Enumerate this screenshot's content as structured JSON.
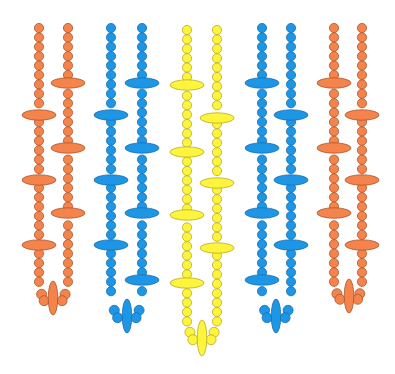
{
  "image": {
    "description": "Beaded fringe pattern illustration: five pairs of vertical bead strands (orange, blue, yellow, blue, orange), each pair joined at the bottom in a U-loop with an elongated vertical pendant bead; strands carry horizontal oval disc beads at intervals.",
    "background": "#ffffff"
  },
  "palette": {
    "orange": {
      "fill": "#f5844c",
      "stroke": "#a8552b"
    },
    "blue": {
      "fill": "#1e96e6",
      "stroke": "#1a6fae"
    },
    "yellow": {
      "fill": "#fdf43c",
      "stroke": "#b8a92a"
    }
  },
  "strands": [
    {
      "color": "orange",
      "left_x": 39,
      "right_x": 68,
      "top": 28,
      "left_discs": [
        115,
        180,
        245
      ],
      "right_discs": [
        83,
        148,
        213
      ],
      "left_end": 285,
      "right_end": 285,
      "pendant": {
        "x": 53,
        "y": 298,
        "ry": 17
      }
    },
    {
      "color": "blue",
      "left_x": 111,
      "right_x": 142,
      "top": 28,
      "left_discs": [
        115,
        180,
        245
      ],
      "right_discs": [
        83,
        148,
        213,
        280
      ],
      "left_end": 300,
      "right_end": 300,
      "pendant": {
        "x": 127,
        "y": 316,
        "ry": 17
      }
    },
    {
      "color": "yellow",
      "left_x": 187,
      "right_x": 217,
      "top": 30,
      "left_discs": [
        85,
        152,
        215,
        283
      ],
      "right_discs": [
        118,
        183,
        248
      ],
      "left_end": 322,
      "right_end": 322,
      "pendant": {
        "x": 202,
        "y": 338,
        "ry": 18
      }
    },
    {
      "color": "blue",
      "left_x": 262,
      "right_x": 291,
      "top": 28,
      "left_discs": [
        83,
        148,
        213,
        280
      ],
      "right_discs": [
        115,
        180,
        245
      ],
      "left_end": 300,
      "right_end": 300,
      "pendant": {
        "x": 276,
        "y": 316,
        "ry": 17
      }
    },
    {
      "color": "orange",
      "left_x": 334,
      "right_x": 362,
      "top": 28,
      "left_discs": [
        83,
        148,
        213
      ],
      "right_discs": [
        115,
        180,
        245
      ],
      "left_end": 285,
      "right_end": 285,
      "pendant": {
        "x": 349,
        "y": 296,
        "ry": 17
      }
    }
  ],
  "bead": {
    "r": 4.6,
    "spacing": 9.4,
    "disc_rx": 17,
    "disc_ry": 5.2,
    "pendant_rx": 4.8
  }
}
